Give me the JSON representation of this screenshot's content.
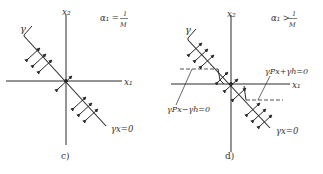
{
  "panels": [
    {
      "id": "c",
      "caption": "c)",
      "x_axis_label": "x₁",
      "y_axis_label": "x₂",
      "condition_lhs": "α₁ =",
      "condition_num": "1",
      "condition_den": "M",
      "gamma_label": "γ",
      "line_label": "γx=0"
    },
    {
      "id": "d",
      "caption": "d)",
      "x_axis_label": "x₁",
      "y_axis_label": "x₂",
      "condition_lhs": "α₁ >",
      "condition_num": "1",
      "condition_den": "M",
      "gamma_label": "γ",
      "line_label": "γx=0",
      "upper_boundary_label": "γPx+γh=0",
      "lower_boundary_label": "γPx−γh=0"
    }
  ],
  "colors": {
    "ink": "#2a2a2a",
    "background": "#ffffff"
  }
}
